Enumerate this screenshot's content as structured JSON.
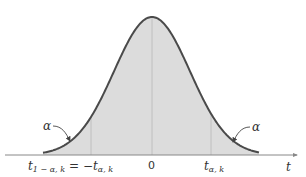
{
  "diagram": {
    "title": "",
    "axis_label": "t",
    "center_label": "0",
    "left_label_main": "t",
    "left_label_sub": "1 − α, k",
    "left_label_eq": "= −t",
    "left_label_eq_sub": "α, k",
    "right_label_main": "t",
    "right_label_sub": "α, k",
    "left_tail_label": "α",
    "right_tail_label": "α",
    "colors": {
      "curve": "#4a4a4a",
      "fill": "#dcdcdc",
      "axis": "#888888",
      "guides": "#b0b0b0"
    }
  }
}
